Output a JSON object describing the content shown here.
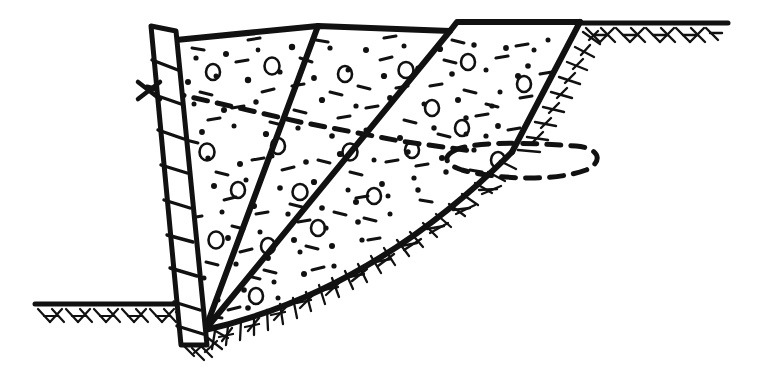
{
  "figure": {
    "title": "Retaining wall with granular backfill, excavation and potential slip surface",
    "type": "engineering-section-diagram",
    "background_color": "#ffffff",
    "ink_color": "#111111",
    "width": 759,
    "height": 390
  },
  "geometry": {
    "wall": {
      "name": "sheet-pile-retaining-wall",
      "hatched": true,
      "top_left": [
        151,
        26
      ],
      "top_right": [
        176,
        31
      ],
      "toe_left": [
        181,
        345
      ],
      "toe_right": [
        207,
        345
      ],
      "rung_count": 9
    },
    "water_level_mark": {
      "name": "water-level-x-mark",
      "x": 146,
      "y": 90,
      "size": 13
    },
    "backfill_surface": {
      "name": "backfill-top-surface",
      "points": [
        [
          176,
          40
        ],
        [
          318,
          26
        ],
        [
          450,
          31
        ],
        [
          457,
          22
        ],
        [
          580,
          22
        ]
      ]
    },
    "wedge_lines": [
      {
        "name": "wedge-line-1",
        "from": [
          318,
          26
        ],
        "to": [
          205,
          330
        ]
      },
      {
        "name": "wedge-line-2",
        "from": [
          450,
          31
        ],
        "to": [
          205,
          330
        ]
      }
    ],
    "excavation_face": {
      "name": "right-excavation-slope",
      "from": [
        580,
        22
      ],
      "to": [
        512,
        152
      ]
    },
    "slip_surface": {
      "name": "curved-slip-failure-surface",
      "start": [
        205,
        330
      ],
      "control": [
        350,
        300
      ],
      "end": [
        512,
        152
      ]
    },
    "ground_line_left": {
      "name": "ground-surface-left",
      "from": [
        35,
        304
      ],
      "to": [
        182,
        304
      ]
    },
    "ground_line_right": {
      "name": "ground-surface-right",
      "from": [
        578,
        23
      ],
      "to": [
        728,
        23
      ]
    },
    "phreatic_line": {
      "name": "phreatic-dashed-line",
      "points": [
        [
          150,
          88
        ],
        [
          300,
          122
        ],
        [
          400,
          140
        ],
        [
          470,
          150
        ]
      ],
      "dash": "12 9"
    },
    "dashed_loop": {
      "name": "dashed-displacement-loop",
      "left_tip": [
        455,
        150
      ],
      "right_tip": [
        596,
        163
      ],
      "top_y": 146,
      "bottom_y": 178
    }
  },
  "textures": {
    "backfill_fill": {
      "name": "granular-backfill-stipple",
      "description": "dots, short dashes and hollow circles",
      "dot_count": 132,
      "ring_count": 22,
      "dash_count": 66
    },
    "ground_hatch": {
      "name": "natural-ground-hatching",
      "description": "short parallel inclined strokes below ground lines"
    }
  },
  "labels": {
    "none_visible": ""
  }
}
